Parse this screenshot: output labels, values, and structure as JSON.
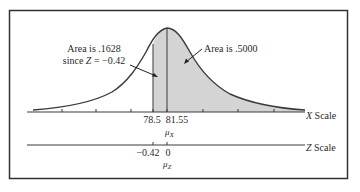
{
  "diagram": {
    "type": "normal-distribution-with-z-transform",
    "annotations": {
      "left_area_line1": "Area is .1628",
      "left_area_line2_prefix": "since ",
      "left_area_line2_var": "Z",
      "left_area_line2_suffix": " = −0.42",
      "right_area": "Area is .5000"
    },
    "x_axis": {
      "label": "X Scale",
      "label_var": "X",
      "label_word": " Scale",
      "ticks": [
        "78.5",
        "81.55"
      ],
      "mean_symbol": "μ",
      "mean_subscript": "X"
    },
    "z_axis": {
      "label": "Z Scale",
      "label_var": "Z",
      "label_word": " Scale",
      "ticks": [
        "−0.42",
        "0"
      ],
      "mean_symbol": "μ",
      "mean_subscript": "Z"
    },
    "colors": {
      "shade": "#d4d4d4",
      "line": "#3a3a3a",
      "border": "#333333"
    }
  }
}
